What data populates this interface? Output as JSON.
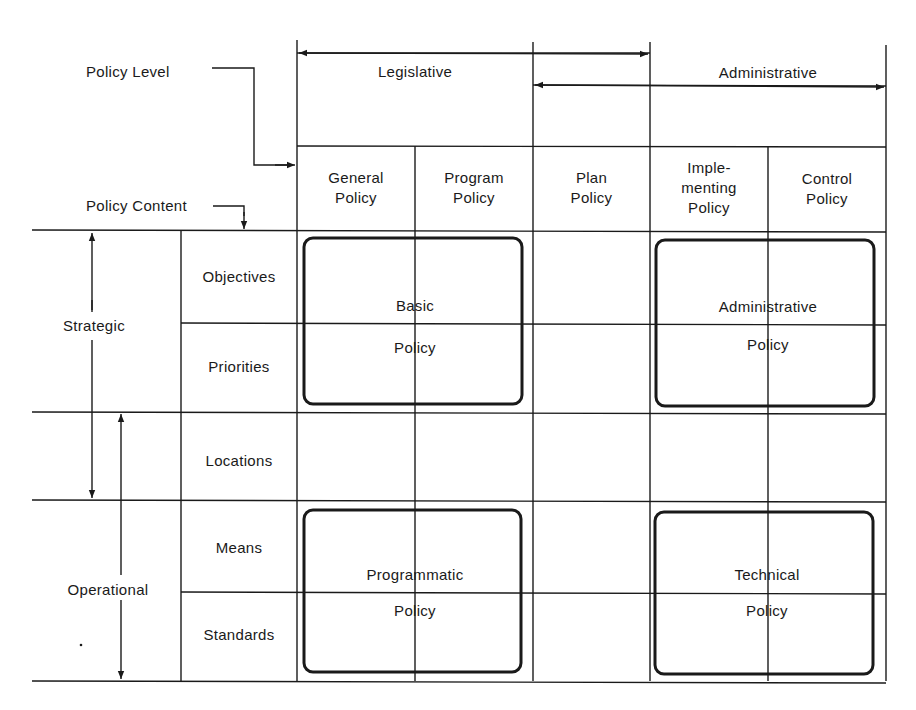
{
  "legend": {
    "policy_level": "Policy Level",
    "policy_content": "Policy Content"
  },
  "levels": {
    "legislative": "Legislative",
    "administrative": "Administrative"
  },
  "columns": [
    {
      "label": "General\nPolicy"
    },
    {
      "label": "Program\nPolicy"
    },
    {
      "label": "Plan\nPolicy"
    },
    {
      "label": "Imple-\nmenting\nPolicy"
    },
    {
      "label": "Control\nPolicy"
    }
  ],
  "categories": {
    "strategic": "Strategic",
    "operational": "Operational"
  },
  "rows": [
    {
      "label": "Objectives"
    },
    {
      "label": "Priorities"
    },
    {
      "label": "Locations"
    },
    {
      "label": "Means"
    },
    {
      "label": "Standards"
    }
  ],
  "policy_boxes": [
    {
      "line1": "Basic",
      "line2": "Policy"
    },
    {
      "line1": "Administrative",
      "line2": "Policy"
    },
    {
      "line1": "Programmatic",
      "line2": "Policy"
    },
    {
      "line1": "Technical",
      "line2": "Policy"
    }
  ],
  "colors": {
    "line": "#1a1a1a",
    "background": "#ffffff"
  }
}
